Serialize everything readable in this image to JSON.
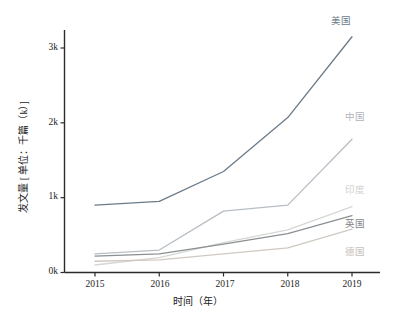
{
  "chart_data": {
    "type": "line",
    "title": "",
    "xlabel": "时间（年）",
    "ylabel": "发文量 [ 单位：千篇（k）]",
    "x": [
      2015,
      2016,
      2017,
      2018,
      2019
    ],
    "categories": [
      "2015",
      "2016",
      "2017",
      "2018",
      "2019"
    ],
    "xtick_labels": [
      "2015",
      "2016",
      "2017",
      "2018",
      "2019"
    ],
    "ytick_labels": [
      "0k",
      "1k",
      "2k",
      "3k"
    ],
    "ytick_values": [
      0,
      1,
      2,
      3
    ],
    "xlim": [
      2014.7,
      2019.3
    ],
    "ylim": [
      0,
      3.3
    ],
    "grid": false,
    "legend": "inline-end-labels",
    "unit": "k (千篇)",
    "series": [
      {
        "name": "美国",
        "color": "#6b7a87",
        "values": [
          0.9,
          0.95,
          1.35,
          2.07,
          3.15
        ],
        "label_text": "美国"
      },
      {
        "name": "中国",
        "color": "#b9bec4",
        "values": [
          0.25,
          0.3,
          0.82,
          0.9,
          1.78
        ],
        "label_text": "中国"
      },
      {
        "name": "印度",
        "color": "#d6d6d2",
        "values": [
          0.1,
          0.2,
          0.4,
          0.57,
          0.88
        ],
        "label_text": "印度"
      },
      {
        "name": "英国",
        "color": "#8a8f94",
        "values": [
          0.22,
          0.25,
          0.38,
          0.52,
          0.76
        ],
        "label_text": "英国"
      },
      {
        "name": "德国",
        "color": "#cfc9c2",
        "values": [
          0.15,
          0.17,
          0.25,
          0.33,
          0.58
        ],
        "label_text": "德国"
      }
    ]
  },
  "axes": {
    "spine_color": "#2b2b2b",
    "y_ticks": [
      {
        "label": "0k",
        "value": 0
      },
      {
        "label": "1k",
        "value": 1
      },
      {
        "label": "2k",
        "value": 2
      },
      {
        "label": "3k",
        "value": 3
      }
    ],
    "x_ticks": [
      {
        "label": "2015",
        "value": 2015
      },
      {
        "label": "2016",
        "value": 2016
      },
      {
        "label": "2017",
        "value": 2017
      },
      {
        "label": "2018",
        "value": 2018
      },
      {
        "label": "2019",
        "value": 2019
      }
    ]
  }
}
